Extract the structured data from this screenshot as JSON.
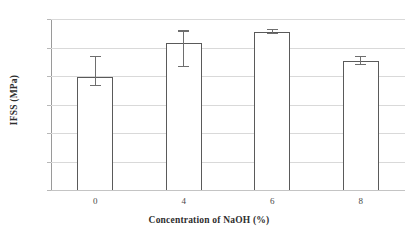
{
  "chart_data": {
    "type": "bar",
    "title": "",
    "xlabel": "Concentration of NaOH (%)",
    "ylabel": "IFSS (MPa)",
    "categories": [
      "0",
      "4",
      "6",
      "8"
    ],
    "values": [
      19.8,
      25.8,
      27.8,
      22.6
    ],
    "error_low": [
      18.2,
      21.5,
      27.4,
      21.9
    ],
    "error_high": [
      23.5,
      28.0,
      28.3,
      23.5
    ],
    "error_minus": [
      1.6,
      4.3,
      0.4,
      0.7
    ],
    "error_plus": [
      3.7,
      2.2,
      0.5,
      0.9
    ],
    "ylim": [
      0,
      30
    ],
    "yticks": [
      0,
      5,
      10,
      15,
      20,
      25,
      30
    ],
    "ytick_labels": [
      "0",
      "5",
      "10",
      "15",
      "20",
      "25",
      "30"
    ],
    "grid": true,
    "legend": "none",
    "bar_fill_color": "#ffffff",
    "bar_edge_color": "#5a5a5a",
    "error_color": "#6e6e6e",
    "grid_color": "#d9d9d9",
    "text_color": "#3a3a3a",
    "background_color": "#ffffff"
  }
}
